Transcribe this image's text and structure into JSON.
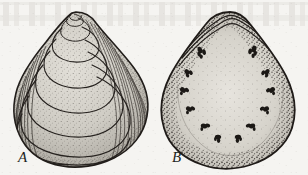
{
  "figure": {
    "caption_labels": [
      "A",
      "B"
    ],
    "background_color": "#f5f4f1",
    "ink_color": "#2b2724",
    "shell_fill_color": "#c9c6bf",
    "specimens": [
      {
        "id": "A",
        "label": "A",
        "view": "exterior",
        "outline": "ovate-trigonal teardrop, umbo at top",
        "growth_ring_count": 8,
        "has_radial_striations": true,
        "shading": "stipple"
      },
      {
        "id": "B",
        "label": "B",
        "view": "interior",
        "outline": "ovate-trigonal teardrop, hinge at top",
        "hinge_line_count": 3,
        "muscle_scar_cluster_count": 12,
        "shading": "dense marginal stipple fading inward"
      }
    ]
  }
}
